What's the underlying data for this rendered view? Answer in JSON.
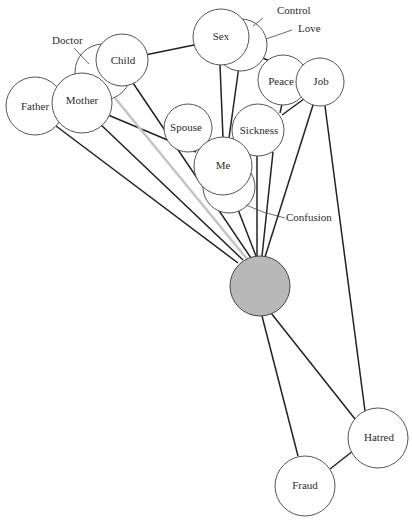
{
  "diagram": {
    "type": "network-of-circles",
    "center_node": {
      "label": "",
      "fill": "#b8b8b8",
      "cx": 260,
      "cy": 286,
      "r": 30
    },
    "nodes": [
      {
        "id": "father",
        "label": "Father",
        "cx": 35,
        "cy": 106,
        "r": 29
      },
      {
        "id": "mother",
        "label": "Mother",
        "cx": 82,
        "cy": 103,
        "r": 30
      },
      {
        "id": "child",
        "label": "Child",
        "cx": 122,
        "cy": 60,
        "r": 26
      },
      {
        "id": "sex",
        "label": "Sex",
        "cx": 221,
        "cy": 37,
        "r": 28
      },
      {
        "id": "peace",
        "label": "Peace",
        "cx": 283,
        "cy": 80,
        "r": 25
      },
      {
        "id": "job",
        "label": "Job",
        "cx": 320,
        "cy": 82,
        "r": 24
      },
      {
        "id": "spouse",
        "label": "Spouse",
        "cx": 188,
        "cy": 128,
        "r": 24
      },
      {
        "id": "sickness",
        "label": "Sickness",
        "cx": 258,
        "cy": 130,
        "r": 26
      },
      {
        "id": "me",
        "label": "Me",
        "cx": 223,
        "cy": 166,
        "r": 29
      },
      {
        "id": "hatred",
        "label": "Hatred",
        "cx": 378,
        "cy": 438,
        "r": 30
      },
      {
        "id": "fraud",
        "label": "Fraud",
        "cx": 305,
        "cy": 486,
        "r": 30
      }
    ],
    "hidden_nodes": [
      {
        "id": "doctor",
        "label": "Doctor",
        "cx": 103,
        "cy": 72,
        "r": 28,
        "label_x": 50,
        "label_y": 42,
        "leader": [
          72,
          47,
          92,
          62
        ]
      },
      {
        "id": "control_love",
        "label_control": "Control",
        "label_love": "Love",
        "cx": 240,
        "cy": 45,
        "r": 26
      },
      {
        "id": "confusion",
        "label": "Confusion",
        "cx": 229,
        "cy": 186,
        "r": 26,
        "label_x": 259,
        "label_y": 218
      }
    ],
    "outside_labels": {
      "doctor": "Doctor",
      "control": "Control",
      "love": "Love",
      "confusion": "Confusion"
    }
  }
}
